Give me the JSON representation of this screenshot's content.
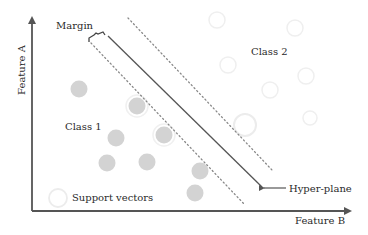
{
  "diagram": {
    "axes": {
      "x_label": "Feature B",
      "y_label": "Feature A"
    },
    "labels": {
      "margin": "Margin",
      "class1": "Class 1",
      "class2": "Class 2",
      "support_vectors": "Support vectors",
      "hyperplane": "Hyper-plane"
    },
    "colors": {
      "axis": "#555555",
      "hyperplane": "#555555",
      "margin_lines": "#888888",
      "class1_fill": "#d3d3d3",
      "class2_outline": "#eeeeee",
      "support_vector_ring": "#e8e8e8"
    },
    "class1_points": [
      {
        "x": 79,
        "y": 89
      },
      {
        "x": 137,
        "y": 106
      },
      {
        "x": 116,
        "y": 138
      },
      {
        "x": 164,
        "y": 135
      },
      {
        "x": 107,
        "y": 163
      },
      {
        "x": 147,
        "y": 162
      },
      {
        "x": 200,
        "y": 171
      },
      {
        "x": 195,
        "y": 193
      }
    ],
    "class2_points": [
      {
        "x": 217,
        "y": 20
      },
      {
        "x": 295,
        "y": 28
      },
      {
        "x": 228,
        "y": 65
      },
      {
        "x": 270,
        "y": 90
      },
      {
        "x": 306,
        "y": 76
      },
      {
        "x": 302,
        "y": 98
      },
      {
        "x": 245,
        "y": 125
      },
      {
        "x": 310,
        "y": 118
      }
    ]
  }
}
